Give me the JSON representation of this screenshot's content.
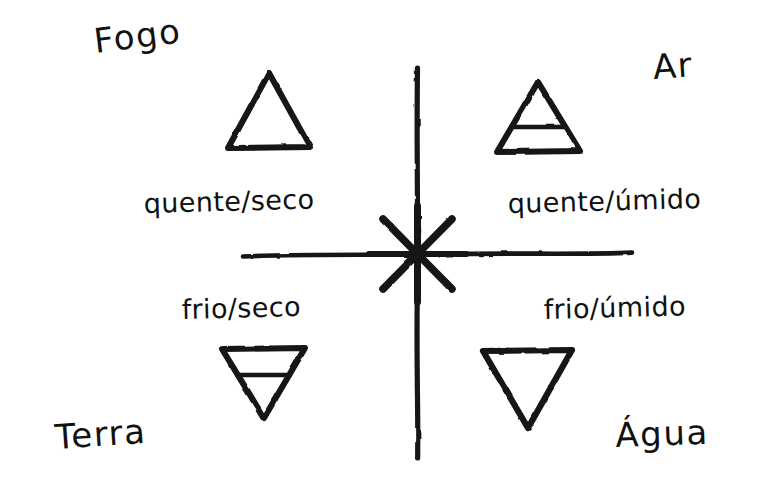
{
  "page": {
    "background_color": "#ffffff",
    "ink_color": "#141414",
    "width": 780,
    "height": 500
  },
  "axes": {
    "vertical": {
      "x": 417,
      "y_top": 68,
      "y_bottom": 458
    },
    "horizontal": {
      "y": 254,
      "x_left": 243,
      "x_right": 632
    },
    "center_star": {
      "name": "eight-point-star",
      "cx": 417,
      "cy": 254,
      "rays": 8,
      "radius": 48
    }
  },
  "elements": [
    {
      "id": "fogo",
      "name": "Fogo",
      "quality": "quente/seco",
      "quadrant": "top-left",
      "symbol": "triangle-up",
      "symbol_has_bar": false
    },
    {
      "id": "ar",
      "name": "Ar",
      "quality": "quente/úmido",
      "quadrant": "top-right",
      "symbol": "triangle-up-barred",
      "symbol_has_bar": true
    },
    {
      "id": "terra",
      "name": "Terra",
      "quality": "frio/seco",
      "quadrant": "bottom-left",
      "symbol": "triangle-down-barred",
      "symbol_has_bar": true
    },
    {
      "id": "agua",
      "name": "Água",
      "quality": "frio/úmido",
      "quadrant": "bottom-right",
      "symbol": "triangle-down",
      "symbol_has_bar": false
    }
  ],
  "symbols": {
    "fogo": {
      "x": 228,
      "y": 73,
      "w": 82,
      "h": 75,
      "direction": "up",
      "bar": null
    },
    "ar": {
      "x": 497,
      "y": 82,
      "w": 83,
      "h": 70,
      "direction": "up",
      "bar": 0.72
    },
    "terra": {
      "x": 222,
      "y": 348,
      "w": 83,
      "h": 70,
      "direction": "down",
      "bar": 0.38
    },
    "agua": {
      "x": 483,
      "y": 350,
      "w": 89,
      "h": 78,
      "direction": "down",
      "bar": null
    }
  }
}
